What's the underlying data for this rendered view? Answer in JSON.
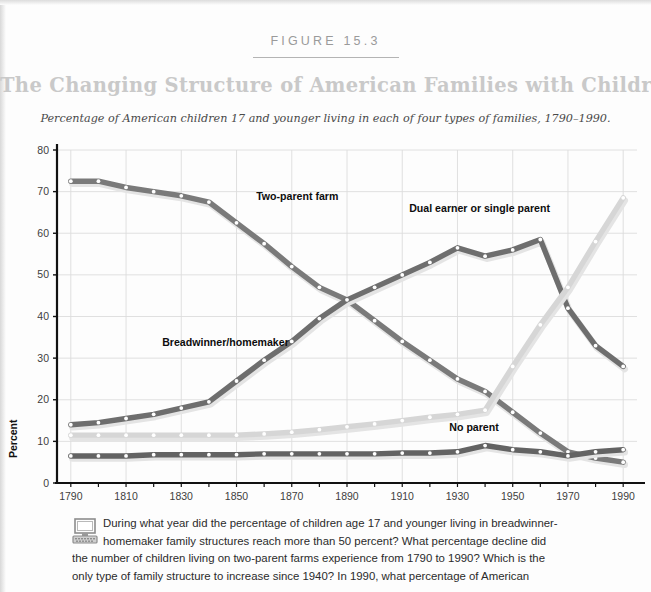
{
  "header": {
    "figure_number": "FIGURE 15.3",
    "title": "The Changing Structure of American Families with Children",
    "subtitle": "Percentage of American children 17 and younger living in each of four types of families, 1790–1990."
  },
  "caption": {
    "icon": "computer-icon",
    "line1": "During what year did the percentage of children age 17 and younger living in breadwinner-",
    "line2": "homemaker family structures reach more than 50 percent? What percentage decline did",
    "line3": "the number of children living on two-parent farms experience from 1790 to 1990? Which is the",
    "line4": "only type of family structure to increase since 1940? In 1990, what percentage of American"
  },
  "chart_data": {
    "type": "line",
    "title": "The Changing Structure of American Families with Children",
    "subtitle": "Percentage of American children 17 and younger living in each of four types of families, 1790–1990.",
    "xlabel": "",
    "ylabel": "Percent",
    "xlim": [
      1785,
      1995
    ],
    "ylim": [
      0,
      80
    ],
    "grid": true,
    "legend_position": "inline-annotations",
    "x": [
      1790,
      1800,
      1810,
      1820,
      1830,
      1840,
      1850,
      1860,
      1870,
      1880,
      1890,
      1900,
      1910,
      1920,
      1930,
      1940,
      1950,
      1960,
      1970,
      1980,
      1990
    ],
    "xticks": [
      1790,
      1810,
      1830,
      1850,
      1870,
      1890,
      1910,
      1930,
      1950,
      1970,
      1990
    ],
    "xticklabels": [
      "1790",
      "1810",
      "1830",
      "1850",
      "1870",
      "1890",
      "1910",
      "1930",
      "1950",
      "1970",
      "1990"
    ],
    "yticks": [
      0,
      10,
      20,
      30,
      40,
      50,
      60,
      70,
      80
    ],
    "yticklabels": [
      "0",
      "10",
      "20",
      "30",
      "40",
      "50",
      "60",
      "70",
      "80"
    ],
    "series": [
      {
        "name": "Two-parent farm",
        "color": "#7a7a7a",
        "label_x": 1872,
        "label_y": 68,
        "values": [
          72.5,
          72.5,
          71,
          70,
          69,
          67.5,
          62.5,
          57.5,
          52,
          47,
          44,
          39,
          34,
          29.5,
          25,
          22,
          17,
          12,
          7.5,
          6,
          5
        ]
      },
      {
        "name": "Breadwinner/homemaker",
        "color": "#6e6e6e",
        "label_x": 1846,
        "label_y": 33,
        "values": [
          14,
          14.5,
          15.5,
          16.5,
          18,
          19.5,
          24.5,
          29.5,
          34,
          39.5,
          44,
          47,
          50,
          53,
          56.5,
          54.5,
          56,
          58.5,
          42,
          33,
          28
        ]
      },
      {
        "name": "Dual earner or single parent",
        "color": "#d6d6d6",
        "label_x": 1938,
        "label_y": 65,
        "values": [
          11.5,
          11.5,
          11.5,
          11.5,
          11.5,
          11.5,
          11.5,
          11.8,
          12.2,
          12.8,
          13.5,
          14.2,
          15,
          15.8,
          16.5,
          17.5,
          28,
          38,
          47,
          58,
          68.5
        ]
      },
      {
        "name": "No parent",
        "color": "#636363",
        "label_x": 1936,
        "label_y": 12.5,
        "values": [
          6.5,
          6.5,
          6.5,
          6.8,
          6.8,
          6.8,
          6.8,
          7,
          7,
          7,
          7,
          7,
          7.2,
          7.2,
          7.5,
          9,
          8,
          7.5,
          6.5,
          7.5,
          8
        ]
      }
    ]
  }
}
